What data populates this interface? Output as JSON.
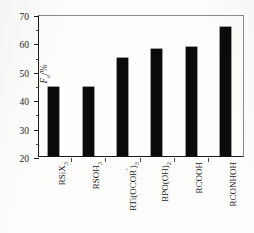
{
  "chart_data": {
    "type": "bar",
    "title": "",
    "subtitle": "",
    "xlabel": "",
    "ylabel": "Fe/%",
    "ylabel_parts": {
      "symbol": "F",
      "subscript": "e",
      "unit": "/%"
    },
    "ylim": [
      20,
      70
    ],
    "y_major_ticks": [
      20,
      30,
      40,
      50,
      60,
      70
    ],
    "y_minor_ticks": [
      25,
      35,
      45,
      55,
      65
    ],
    "grid": false,
    "legend": null,
    "bar_color": "#0b0b0b",
    "axis_color": "#1c1c1c",
    "background_color": "#fdfdfc",
    "categories": [
      "RSiX3",
      "RSO3H",
      "RTi(OCOR')3",
      "RPO(OH)2",
      "RCOOH",
      "RCONHOH"
    ],
    "values": [
      44.2,
      44.2,
      54.5,
      57.7,
      58.5,
      65.3
    ],
    "category_labels": [
      {
        "base": "RSiX",
        "sub": "3",
        "prime": "",
        "tail": ""
      },
      {
        "base": "RSO",
        "sub": "3",
        "prime": "",
        "tail": "H"
      },
      {
        "base": "RTi(OCOR",
        "sub": "3",
        "prime": "'",
        "tail": ")"
      },
      {
        "base": "RPO(OH)",
        "sub": "2",
        "prime": "",
        "tail": ""
      },
      {
        "base": "RCOOH",
        "sub": "",
        "prime": "",
        "tail": ""
      },
      {
        "base": "RCONHOH",
        "sub": "",
        "prime": "",
        "tail": ""
      }
    ]
  }
}
